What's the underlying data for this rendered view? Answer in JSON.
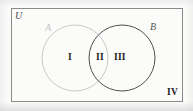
{
  "figure": {
    "type": "venn-diagram",
    "sets": 2,
    "universe_label": "U",
    "set_a_label": "A",
    "set_b_label": "B",
    "regions": [
      {
        "id": "i",
        "label": "I",
        "meaning": "A only"
      },
      {
        "id": "ii",
        "label": "II",
        "meaning": "A and B"
      },
      {
        "id": "iii",
        "label": "III",
        "meaning": "B only"
      },
      {
        "id": "iv",
        "label": "IV",
        "meaning": "outside A and B"
      }
    ],
    "colors": {
      "universe_border": "#8a8a8a",
      "circle_a_stroke": "#c9c9c9",
      "circle_b_stroke": "#4f4f4f",
      "label_text": "#1c1c1c",
      "background": "#fbfbfa"
    },
    "geometry": {
      "universe_rect": {
        "x": 11,
        "y": 8,
        "width": 171,
        "height": 94
      },
      "circle_a": {
        "cx": 75,
        "cy": 58,
        "r": 33
      },
      "circle_b": {
        "cx": 122,
        "cy": 58,
        "r": 33
      }
    }
  }
}
